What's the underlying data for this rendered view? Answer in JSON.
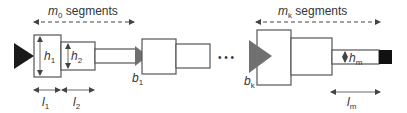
{
  "diagram": {
    "group_left_label": {
      "var": "m",
      "sub": "0",
      "suffix": " segments"
    },
    "group_right_label": {
      "var": "m",
      "sub": "k",
      "suffix": " segments"
    },
    "heights": [
      {
        "var": "h",
        "sub": "1"
      },
      {
        "var": "h",
        "sub": "2"
      },
      {
        "var": "h",
        "sub": "m"
      }
    ],
    "lengths": [
      {
        "var": "l",
        "sub": "1"
      },
      {
        "var": "l",
        "sub": "2"
      },
      {
        "var": "l",
        "sub": "m"
      }
    ],
    "branches": [
      {
        "var": "b",
        "sub": "1"
      },
      {
        "var": "b",
        "sub": "k"
      }
    ],
    "ellipsis": "• • •",
    "colors": {
      "line": "#555555",
      "root_triangle": "#1a1a1a",
      "branch_triangle": "#707070",
      "tip_block": "#111111"
    }
  }
}
